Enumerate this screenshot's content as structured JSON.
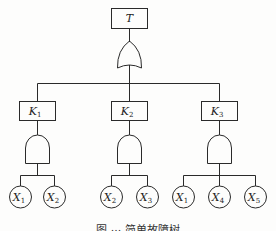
{
  "diagram": {
    "type": "fault-tree",
    "top_event": {
      "label": "T",
      "gate": "OR"
    },
    "intermediate_events": [
      {
        "label": "K",
        "sub": "1",
        "gate": "AND",
        "children": [
          {
            "label": "X",
            "sub": "1"
          },
          {
            "label": "X",
            "sub": "2"
          }
        ]
      },
      {
        "label": "K",
        "sub": "2",
        "gate": "AND",
        "children": [
          {
            "label": "X",
            "sub": "2"
          },
          {
            "label": "X",
            "sub": "3"
          }
        ]
      },
      {
        "label": "K",
        "sub": "3",
        "gate": "AND",
        "children": [
          {
            "label": "X",
            "sub": "1"
          },
          {
            "label": "X",
            "sub": "4"
          },
          {
            "label": "X",
            "sub": "5"
          }
        ]
      }
    ],
    "caption": "图 ··· 简单故障树"
  }
}
